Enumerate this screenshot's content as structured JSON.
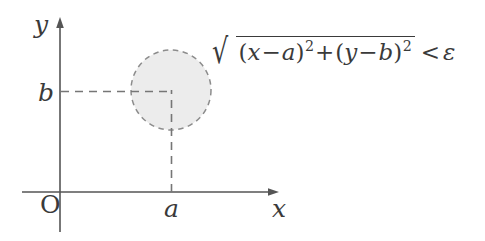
{
  "figure": {
    "kind": "coordinate-axes-diagram",
    "background_color": "#ffffff",
    "line_color": "#555555",
    "text_color": "#3a3a3a",
    "disk_fill_color": "#ececec",
    "disk_stroke_color": "#8c8c8c"
  },
  "axes": {
    "x_axis_label": "x",
    "y_axis_label": "y",
    "origin_label": "O",
    "x_tick_label": "a",
    "y_tick_label": "b",
    "x_axis_y_px": 192,
    "y_axis_x_px": 60,
    "x_axis_end_px": 277,
    "y_axis_top_px": 22,
    "y_axis_bottom_px": 232
  },
  "disk": {
    "center_x_px": 171,
    "center_y_px": 90,
    "radius_px": 40,
    "border_style": "dashed",
    "center_label_x": "a",
    "center_label_y": "b"
  },
  "formula": {
    "full_text": "sqrt((x - a)^2 + (y - b)^2) < epsilon",
    "radical_symbol": "√",
    "open_paren": "(",
    "var_x": "x",
    "minus": "−",
    "var_a": "a",
    "close_paren": ")",
    "exponent_two": "2",
    "plus": "+",
    "var_y": "y",
    "var_b": "b",
    "less_than": "<",
    "epsilon": "ε"
  }
}
